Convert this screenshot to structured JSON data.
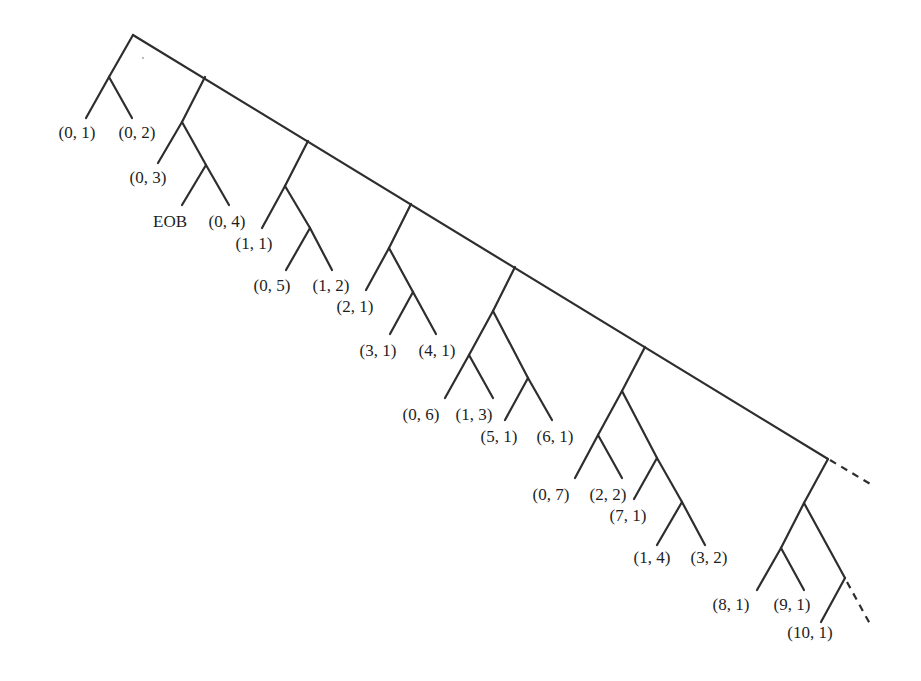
{
  "diagram": {
    "type": "binary-code-tree",
    "colors": {
      "line": "#2e2e2e",
      "text": "#1e1e1e",
      "background": "#ffffff"
    },
    "labels": [
      {
        "id": "l01",
        "text": "(0, 1)",
        "x": 77,
        "y": 138
      },
      {
        "id": "l02",
        "text": "(0, 2)",
        "x": 137,
        "y": 138
      },
      {
        "id": "l03",
        "text": "(0, 3)",
        "x": 148,
        "y": 183
      },
      {
        "id": "l04",
        "text": "EOB",
        "x": 170,
        "y": 227
      },
      {
        "id": "l05",
        "text": "(0, 4)",
        "x": 227,
        "y": 227
      },
      {
        "id": "l06",
        "text": "(1, 1)",
        "x": 254,
        "y": 249
      },
      {
        "id": "l07",
        "text": "(0, 5)",
        "x": 272,
        "y": 291
      },
      {
        "id": "l08",
        "text": "(1, 2)",
        "x": 331,
        "y": 291
      },
      {
        "id": "l09",
        "text": "(2, 1)",
        "x": 355,
        "y": 312
      },
      {
        "id": "l10",
        "text": "(3, 1)",
        "x": 378,
        "y": 356
      },
      {
        "id": "l11",
        "text": "(4, 1)",
        "x": 437,
        "y": 356
      },
      {
        "id": "l12",
        "text": "(0, 6)",
        "x": 421,
        "y": 420
      },
      {
        "id": "l13",
        "text": "(1, 3)",
        "x": 474,
        "y": 420
      },
      {
        "id": "l14",
        "text": "(5, 1)",
        "x": 499,
        "y": 442
      },
      {
        "id": "l15",
        "text": "(6, 1)",
        "x": 555,
        "y": 442
      },
      {
        "id": "l16",
        "text": "(0, 7)",
        "x": 551,
        "y": 500
      },
      {
        "id": "l17",
        "text": "(2, 2)",
        "x": 608,
        "y": 500
      },
      {
        "id": "l18",
        "text": "(7, 1)",
        "x": 628,
        "y": 521
      },
      {
        "id": "l19",
        "text": "(1, 4)",
        "x": 652,
        "y": 563
      },
      {
        "id": "l20",
        "text": "(3, 2)",
        "x": 709,
        "y": 563
      },
      {
        "id": "l21",
        "text": "(8, 1)",
        "x": 731,
        "y": 610
      },
      {
        "id": "l22",
        "text": "(9, 1)",
        "x": 792,
        "y": 610
      },
      {
        "id": "l23",
        "text": "(10, 1)",
        "x": 810,
        "y": 638
      }
    ],
    "edges": [
      {
        "id": "spine",
        "points": [
          [
            133,
            35
          ],
          [
            828,
            459
          ]
        ],
        "dashed": false
      },
      {
        "id": "spine-continuation",
        "points": [
          [
            830,
            460
          ],
          [
            872,
            485
          ]
        ],
        "dashed": true
      },
      {
        "id": "g1-a",
        "points": [
          [
            133,
            35
          ],
          [
            109,
            77
          ]
        ]
      },
      {
        "id": "g1-b",
        "points": [
          [
            109,
            77
          ],
          [
            86,
            118
          ]
        ]
      },
      {
        "id": "g1-c",
        "points": [
          [
            109,
            77
          ],
          [
            132,
            118
          ]
        ]
      },
      {
        "id": "g2-a",
        "points": [
          [
            205,
            77
          ],
          [
            182,
            122
          ]
        ]
      },
      {
        "id": "g2-b",
        "points": [
          [
            182,
            122
          ],
          [
            158,
            163
          ]
        ]
      },
      {
        "id": "g2-c",
        "points": [
          [
            182,
            122
          ],
          [
            206,
            165
          ]
        ]
      },
      {
        "id": "g2-d",
        "points": [
          [
            206,
            165
          ],
          [
            182,
            205
          ]
        ]
      },
      {
        "id": "g2-e",
        "points": [
          [
            206,
            165
          ],
          [
            229,
            205
          ]
        ]
      },
      {
        "id": "g3-a",
        "points": [
          [
            308,
            141
          ],
          [
            285,
            186
          ]
        ]
      },
      {
        "id": "g3-b",
        "points": [
          [
            285,
            186
          ],
          [
            262,
            228
          ]
        ]
      },
      {
        "id": "g3-c",
        "points": [
          [
            285,
            186
          ],
          [
            310,
            228
          ]
        ]
      },
      {
        "id": "g3-d",
        "points": [
          [
            310,
            228
          ],
          [
            286,
            270
          ]
        ]
      },
      {
        "id": "g3-e",
        "points": [
          [
            310,
            228
          ],
          [
            332,
            270
          ]
        ]
      },
      {
        "id": "g4-a",
        "points": [
          [
            411,
            204
          ],
          [
            389,
            248
          ]
        ]
      },
      {
        "id": "g4-b",
        "points": [
          [
            389,
            248
          ],
          [
            366,
            290
          ]
        ]
      },
      {
        "id": "g4-c",
        "points": [
          [
            389,
            248
          ],
          [
            413,
            292
          ]
        ]
      },
      {
        "id": "g4-d",
        "points": [
          [
            413,
            292
          ],
          [
            390,
            334
          ]
        ]
      },
      {
        "id": "g4-e",
        "points": [
          [
            413,
            292
          ],
          [
            436,
            334
          ]
        ]
      },
      {
        "id": "g5-a",
        "points": [
          [
            515,
            267
          ],
          [
            493,
            311
          ]
        ]
      },
      {
        "id": "g5-b",
        "points": [
          [
            493,
            311
          ],
          [
            469,
            355
          ]
        ]
      },
      {
        "id": "g5-c",
        "points": [
          [
            469,
            355
          ],
          [
            445,
            398
          ]
        ]
      },
      {
        "id": "g5-d",
        "points": [
          [
            469,
            355
          ],
          [
            493,
            398
          ]
        ]
      },
      {
        "id": "g5-e",
        "points": [
          [
            493,
            311
          ],
          [
            528,
            378
          ]
        ]
      },
      {
        "id": "g5-f",
        "points": [
          [
            528,
            378
          ],
          [
            505,
            420
          ]
        ]
      },
      {
        "id": "g5-g",
        "points": [
          [
            528,
            378
          ],
          [
            552,
            420
          ]
        ]
      },
      {
        "id": "g6-a",
        "points": [
          [
            645,
            347
          ],
          [
            622,
            391
          ]
        ]
      },
      {
        "id": "g6-b",
        "points": [
          [
            622,
            391
          ],
          [
            598,
            435
          ]
        ]
      },
      {
        "id": "g6-c",
        "points": [
          [
            598,
            435
          ],
          [
            575,
            478
          ]
        ]
      },
      {
        "id": "g6-d",
        "points": [
          [
            598,
            435
          ],
          [
            622,
            478
          ]
        ]
      },
      {
        "id": "g6-e",
        "points": [
          [
            622,
            391
          ],
          [
            657,
            458
          ]
        ]
      },
      {
        "id": "g6-f",
        "points": [
          [
            657,
            458
          ],
          [
            634,
            499
          ]
        ]
      },
      {
        "id": "g6-g",
        "points": [
          [
            657,
            458
          ],
          [
            682,
            502
          ]
        ]
      },
      {
        "id": "g6-h",
        "points": [
          [
            682,
            502
          ],
          [
            657,
            545
          ]
        ]
      },
      {
        "id": "g6-i",
        "points": [
          [
            682,
            502
          ],
          [
            705,
            545
          ]
        ]
      },
      {
        "id": "g7-a",
        "points": [
          [
            828,
            459
          ],
          [
            804,
            503
          ]
        ]
      },
      {
        "id": "g7-b",
        "points": [
          [
            804,
            503
          ],
          [
            781,
            548
          ]
        ]
      },
      {
        "id": "g7-c",
        "points": [
          [
            781,
            548
          ],
          [
            757,
            590
          ]
        ]
      },
      {
        "id": "g7-d",
        "points": [
          [
            781,
            548
          ],
          [
            804,
            590
          ]
        ]
      },
      {
        "id": "g7-e",
        "points": [
          [
            804,
            503
          ],
          [
            845,
            578
          ]
        ]
      },
      {
        "id": "g7-f",
        "points": [
          [
            845,
            578
          ],
          [
            821,
            622
          ]
        ]
      },
      {
        "id": "g7-continuation",
        "points": [
          [
            847,
            582
          ],
          [
            870,
            624
          ]
        ],
        "dashed": true
      }
    ]
  }
}
